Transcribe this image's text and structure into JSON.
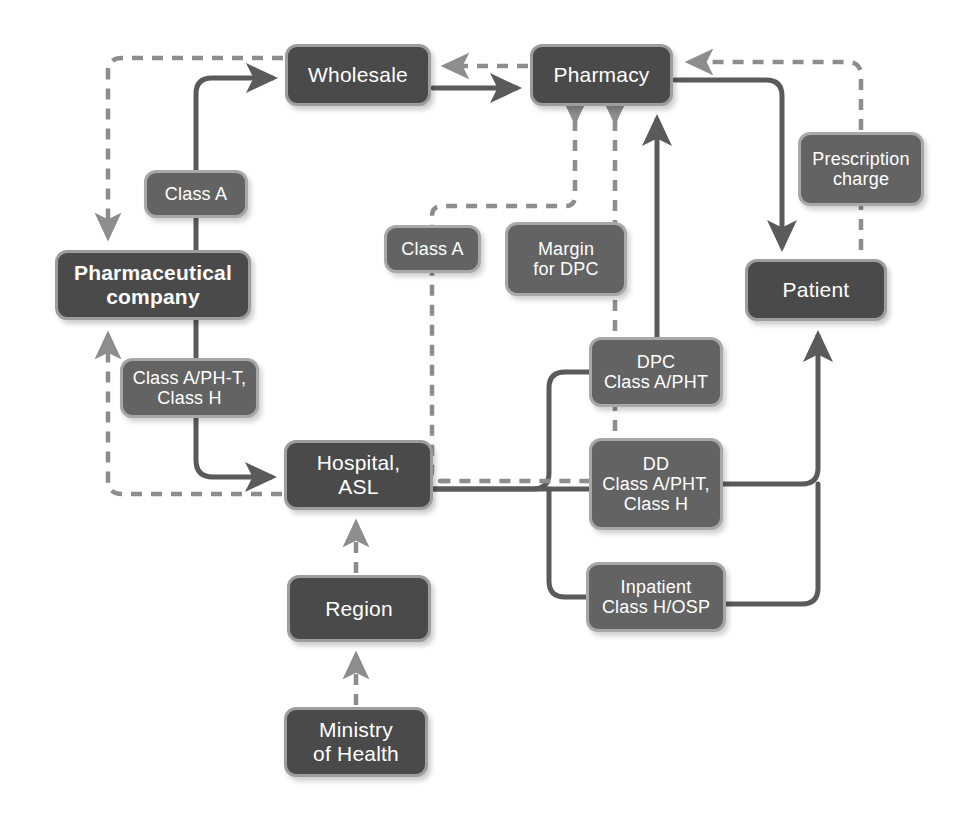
{
  "diagram": {
    "colors": {
      "primary_box_fill": "#4a4a4a",
      "primary_box_border": "#9d9d9d",
      "label_box_fill": "#636363",
      "label_box_border": "#a8a8a8",
      "text": "#ffffff",
      "solid_edge": "#5a5a5a",
      "dashed_edge": "#8d8d8d",
      "background": "#ffffff"
    },
    "nodes": [
      {
        "id": "wholesale",
        "label": "Wholesale",
        "kind": "primary",
        "bold": false,
        "x": 285,
        "y": 44,
        "w": 146,
        "h": 62
      },
      {
        "id": "pharmacy",
        "label": "Pharmacy",
        "kind": "primary",
        "bold": false,
        "x": 530,
        "y": 44,
        "w": 143,
        "h": 62
      },
      {
        "id": "class-a-left",
        "label": "Class A",
        "kind": "label",
        "bold": false,
        "x": 144,
        "y": 170,
        "w": 104,
        "h": 48
      },
      {
        "id": "pharma-co",
        "label": "Pharmaceutical\ncompany",
        "kind": "primary",
        "bold": true,
        "x": 55,
        "y": 250,
        "w": 196,
        "h": 70
      },
      {
        "id": "class-a-ph-t",
        "label": "Class A/PH-T,\nClass H",
        "kind": "label",
        "bold": false,
        "x": 120,
        "y": 358,
        "w": 139,
        "h": 60
      },
      {
        "id": "class-a-mid",
        "label": "Class A",
        "kind": "label",
        "bold": false,
        "x": 384,
        "y": 225,
        "w": 97,
        "h": 48
      },
      {
        "id": "margin-dpc",
        "label": "Margin\nfor DPC",
        "kind": "label",
        "bold": false,
        "x": 505,
        "y": 222,
        "w": 122,
        "h": 74
      },
      {
        "id": "prescription",
        "label": "Prescription\ncharge",
        "kind": "label",
        "bold": false,
        "x": 798,
        "y": 132,
        "w": 126,
        "h": 74
      },
      {
        "id": "patient",
        "label": "Patient",
        "kind": "primary",
        "bold": false,
        "x": 745,
        "y": 259,
        "w": 142,
        "h": 62
      },
      {
        "id": "dpc",
        "label": "DPC\nClass A/PHT",
        "kind": "label",
        "bold": false,
        "x": 589,
        "y": 337,
        "w": 134,
        "h": 70
      },
      {
        "id": "hospital-asl",
        "label": "Hospital,\nASL",
        "kind": "primary",
        "bold": false,
        "x": 284,
        "y": 440,
        "w": 149,
        "h": 70
      },
      {
        "id": "dd",
        "label": "DD\nClass A/PHT,\nClass H",
        "kind": "label",
        "bold": false,
        "x": 589,
        "y": 438,
        "w": 134,
        "h": 92
      },
      {
        "id": "inpatient",
        "label": "Inpatient\nClass H/OSP",
        "kind": "label",
        "bold": false,
        "x": 586,
        "y": 562,
        "w": 140,
        "h": 70
      },
      {
        "id": "region",
        "label": "Region",
        "kind": "primary",
        "bold": false,
        "x": 287,
        "y": 575,
        "w": 144,
        "h": 67
      },
      {
        "id": "ministry",
        "label": "Ministry\nof Health",
        "kind": "primary",
        "bold": false,
        "x": 284,
        "y": 707,
        "w": 144,
        "h": 70
      }
    ],
    "edges": [
      {
        "id": "pharma-to-wholesale",
        "from": "pharma-co",
        "to": "wholesale",
        "style": "solid",
        "label_node": "class-a-left"
      },
      {
        "id": "wholesale-to-pharmacy",
        "from": "wholesale",
        "to": "pharmacy",
        "style": "solid",
        "label_node": null
      },
      {
        "id": "pharmacy-to-wholesale",
        "from": "pharmacy",
        "to": "wholesale",
        "style": "dashed",
        "label_node": null
      },
      {
        "id": "wholesale-to-pharma",
        "from": "wholesale",
        "to": "pharma-co",
        "style": "dashed",
        "label_node": null
      },
      {
        "id": "pharma-to-hospital",
        "from": "pharma-co",
        "to": "hospital-asl",
        "style": "solid",
        "label_node": "class-a-ph-t"
      },
      {
        "id": "hospital-to-pharma",
        "from": "hospital-asl",
        "to": "pharma-co",
        "style": "dashed",
        "label_node": null
      },
      {
        "id": "hospital-to-pharmacy-classa",
        "from": "hospital-asl",
        "to": "pharmacy",
        "style": "dashed",
        "label_node": "class-a-mid"
      },
      {
        "id": "hospital-to-pharmacy-margin",
        "from": "hospital-asl",
        "to": "pharmacy",
        "style": "dashed",
        "label_node": "margin-dpc"
      },
      {
        "id": "hospital-to-pharmacy-dpc",
        "from": "hospital-asl",
        "to": "pharmacy",
        "style": "solid",
        "label_node": "dpc"
      },
      {
        "id": "pharmacy-to-patient",
        "from": "pharmacy",
        "to": "patient",
        "style": "solid",
        "label_node": null
      },
      {
        "id": "patient-to-pharmacy",
        "from": "patient",
        "to": "pharmacy",
        "style": "dashed",
        "label_node": "prescription"
      },
      {
        "id": "hospital-to-patient-dd",
        "from": "hospital-asl",
        "to": "patient",
        "style": "solid",
        "label_node": "dd"
      },
      {
        "id": "hospital-to-patient-inpat",
        "from": "hospital-asl",
        "to": "patient",
        "style": "solid",
        "label_node": "inpatient"
      },
      {
        "id": "region-to-hospital",
        "from": "region",
        "to": "hospital-asl",
        "style": "dashed",
        "label_node": null
      },
      {
        "id": "ministry-to-region",
        "from": "ministry",
        "to": "region",
        "style": "dashed",
        "label_node": null
      }
    ]
  }
}
